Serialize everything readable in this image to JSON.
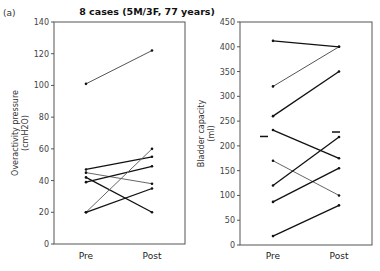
{
  "panel_label": "(a)",
  "chart_data": [
    {
      "type": "line",
      "title": "8 cases (5M/3F, 77 years)",
      "xlabel": "",
      "ylabel": "Overactivity pressure",
      "ylabel_unit": "(cmH2O)",
      "categories": [
        "Pre",
        "Post"
      ],
      "ylim": [
        0,
        140
      ],
      "yticks": [
        0,
        20,
        40,
        60,
        80,
        100,
        120,
        140
      ],
      "grid": false,
      "series": [
        {
          "name": "case-1",
          "values": [
            101,
            122
          ],
          "color": "#555555"
        },
        {
          "name": "case-2",
          "values": [
            47,
            55
          ],
          "color": "#111111"
        },
        {
          "name": "case-3",
          "values": [
            45,
            38
          ],
          "color": "#666666"
        },
        {
          "name": "case-4",
          "values": [
            42,
            20
          ],
          "color": "#111111"
        },
        {
          "name": "case-5",
          "values": [
            39,
            49
          ],
          "color": "#111111"
        },
        {
          "name": "case-6",
          "values": [
            20,
            60
          ],
          "color": "#666666"
        },
        {
          "name": "case-7",
          "values": [
            20,
            35
          ],
          "color": "#111111"
        }
      ]
    },
    {
      "type": "line",
      "title": "",
      "xlabel": "",
      "ylabel": "Bladder capacity",
      "ylabel_unit": "(ml)",
      "categories": [
        "Pre",
        "Post"
      ],
      "ylim": [
        0,
        450
      ],
      "yticks": [
        0,
        50,
        100,
        150,
        200,
        250,
        300,
        350,
        400,
        450
      ],
      "grid": false,
      "series": [
        {
          "name": "case-1",
          "values": [
            412,
            400
          ],
          "color": "#111111"
        },
        {
          "name": "case-2",
          "values": [
            320,
            400
          ],
          "color": "#555555"
        },
        {
          "name": "case-3",
          "values": [
            260,
            350
          ],
          "color": "#111111"
        },
        {
          "name": "case-4",
          "values": [
            232,
            175
          ],
          "color": "#111111"
        },
        {
          "name": "case-5",
          "values": [
            170,
            100
          ],
          "color": "#666666"
        },
        {
          "name": "case-6",
          "values": [
            120,
            218
          ],
          "color": "#111111"
        },
        {
          "name": "case-7",
          "values": [
            87,
            155
          ],
          "color": "#111111"
        },
        {
          "name": "case-8",
          "values": [
            18,
            80
          ],
          "color": "#111111"
        }
      ],
      "mean_markers": [
        219,
        228
      ]
    }
  ]
}
